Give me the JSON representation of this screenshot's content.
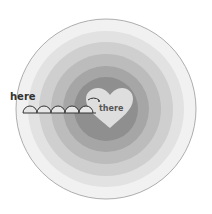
{
  "labels": {
    "start": "here",
    "end": "there"
  },
  "rings": {
    "center": [
      106,
      109
    ],
    "radii": [
      90,
      78,
      67,
      55,
      43,
      32
    ],
    "colors": [
      "#f1f1f1",
      "#e2e2e2",
      "#cfcfcf",
      "#bcbcbc",
      "#a6a6a6",
      "#8f8f8f"
    ],
    "outline": "#9a9a9a"
  },
  "heart": {
    "color": "#dedede"
  },
  "hops": {
    "count": 5,
    "color": "#333333"
  }
}
